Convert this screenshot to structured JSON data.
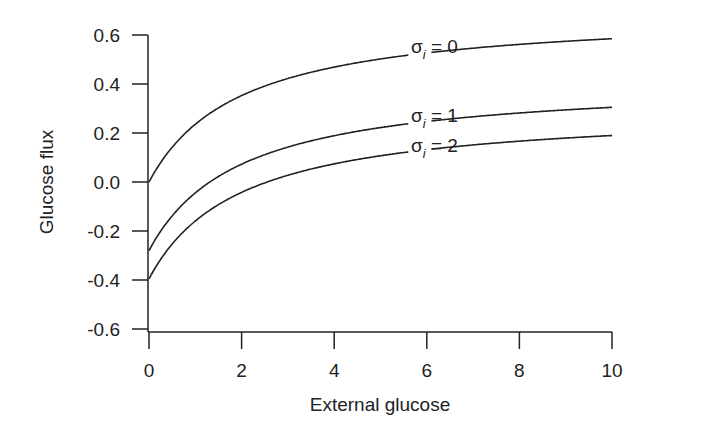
{
  "chart_data": {
    "type": "line",
    "title": "",
    "xlabel": "External glucose",
    "ylabel": "Glucose flux",
    "xlim": [
      0,
      10
    ],
    "ylim": [
      -0.6,
      0.6
    ],
    "x_ticks": [
      "0",
      "2",
      "4",
      "6",
      "8",
      "10"
    ],
    "y_ticks": [
      "0.6",
      "0.4",
      "0.2",
      "0.0",
      "-0.2",
      "-0.4",
      "-0.6"
    ],
    "grid": false,
    "legend": "inline labels on curves",
    "x": [
      0,
      0.25,
      0.5,
      0.75,
      1,
      1.5,
      2,
      2.5,
      3,
      4,
      5,
      6,
      7,
      8,
      9,
      10
    ],
    "series": [
      {
        "name": "σi = 0",
        "values": [
          0.0,
          0.079,
          0.141,
          0.192,
          0.235,
          0.302,
          0.352,
          0.391,
          0.421,
          0.468,
          0.501,
          0.527,
          0.546,
          0.562,
          0.575,
          0.585
        ]
      },
      {
        "name": "σi = 1",
        "values": [
          -0.28,
          -0.201,
          -0.139,
          -0.088,
          -0.045,
          0.022,
          0.072,
          0.111,
          0.141,
          0.188,
          0.221,
          0.247,
          0.266,
          0.282,
          0.295,
          0.305
        ]
      },
      {
        "name": "σi = 2",
        "values": [
          -0.395,
          -0.316,
          -0.254,
          -0.203,
          -0.16,
          -0.093,
          -0.043,
          -0.004,
          0.026,
          0.073,
          0.106,
          0.132,
          0.151,
          0.167,
          0.18,
          0.19
        ]
      }
    ],
    "annotations": [
      {
        "label": "σi = 0",
        "x": 5.8,
        "y": 0.52
      },
      {
        "label": "σi = 1",
        "x": 5.8,
        "y": 0.26
      },
      {
        "label": "σi = 2",
        "x": 5.8,
        "y": 0.15
      }
    ]
  }
}
